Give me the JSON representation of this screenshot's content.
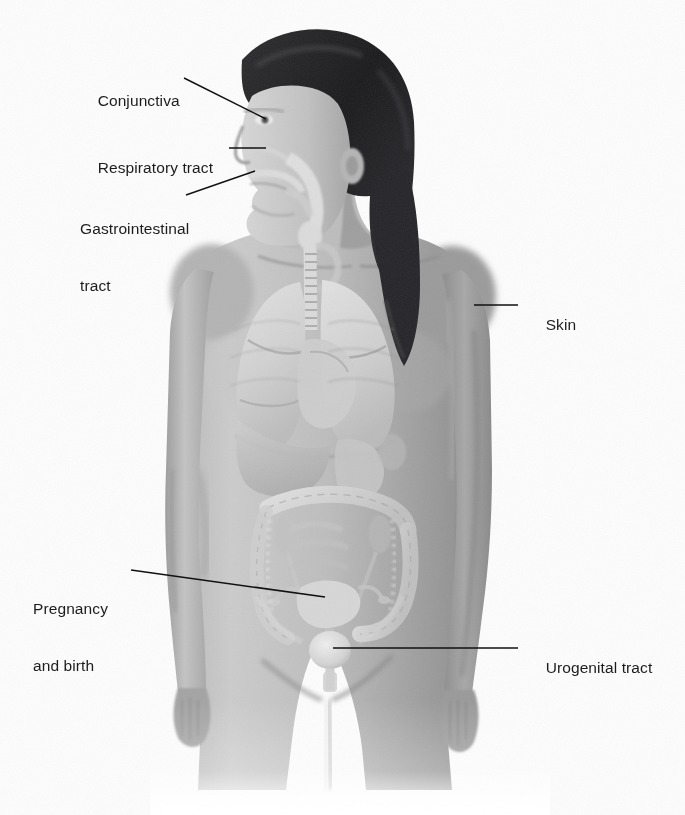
{
  "figure": {
    "background_color": "#fdfdfd",
    "label_color": "#1c1c1c",
    "leader_color": "#111111"
  },
  "labels": [
    {
      "id": "conjunctiva",
      "text": "Conjunctiva",
      "lines": [
        "Conjunctiva"
      ],
      "side": "left",
      "x": 80,
      "y": 72,
      "leader": {
        "x1": 184,
        "y1": 78,
        "x2": 266,
        "y2": 119
      }
    },
    {
      "id": "respiratory-tract",
      "text": "Respiratory tract",
      "lines": [
        "Respiratory tract"
      ],
      "side": "left",
      "x": 80,
      "y": 139,
      "leader": {
        "x1": 229,
        "y1": 148,
        "x2": 266,
        "y2": 148
      }
    },
    {
      "id": "gastrointestinal-tract",
      "text": "Gastrointestinal tract",
      "lines": [
        "Gastrointestinal",
        "tract"
      ],
      "side": "left",
      "x": 80,
      "y": 181,
      "leader": {
        "x1": 186,
        "y1": 195,
        "x2": 255,
        "y2": 171
      }
    },
    {
      "id": "skin",
      "text": "Skin",
      "lines": [
        "Skin"
      ],
      "side": "right",
      "x": 528,
      "y": 296,
      "leader": {
        "x1": 474,
        "y1": 305,
        "x2": 518,
        "y2": 305
      }
    },
    {
      "id": "pregnancy-and-birth",
      "text": "Pregnancy and birth",
      "lines": [
        "Pregnancy",
        "and birth"
      ],
      "side": "left",
      "x": 33,
      "y": 561,
      "leader": {
        "x1": 131,
        "y1": 570,
        "x2": 325,
        "y2": 597
      }
    },
    {
      "id": "urogenital-tract",
      "text": "Urogenital tract",
      "lines": [
        "Urogenital tract"
      ],
      "side": "right",
      "x": 528,
      "y": 639,
      "leader": {
        "x1": 333,
        "y1": 648,
        "x2": 518,
        "y2": 648
      }
    }
  ],
  "anatomy": {
    "regions": [
      "hair",
      "face",
      "neck",
      "trachea",
      "lungs",
      "heart",
      "diaphragm",
      "liver",
      "stomach",
      "colon",
      "small-intestine",
      "kidneys",
      "uterus",
      "bladder",
      "arms",
      "thighs"
    ],
    "palette": {
      "hair_dark": "#232326",
      "skin_mid": "#a3a3a3",
      "skin_light": "#c9c9c9",
      "skin_shadow": "#8a8a8a",
      "organ_light": "#dcdcdc",
      "organ_mid": "#b5b5b5",
      "outline": "#7a7a7a"
    }
  }
}
